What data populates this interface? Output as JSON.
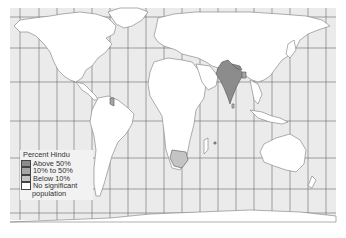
{
  "map": {
    "title": "Percent Hindu",
    "type": "world choropleth",
    "colors": {
      "ocean": "#ebebeb",
      "land": "#ffffff",
      "border": "#7a7a7a",
      "grid": "#6a6a6a",
      "above_50": "#8c8c8c",
      "10_to_50": "#a6a6a6",
      "below_10": "#c4c4c4",
      "none": "#ffffff"
    },
    "highlighted_regions": [
      {
        "region": "India",
        "category": "Above 50%"
      },
      {
        "region": "Nepal",
        "category": "Above 50%"
      },
      {
        "region": "Bangladesh",
        "category": "10% to 50%"
      },
      {
        "region": "Guyana / Suriname",
        "category": "10% to 50%"
      },
      {
        "region": "South Africa",
        "category": "Below 10%"
      }
    ]
  },
  "legend": {
    "title": "Percent Hindu",
    "items": [
      {
        "label": "Above 50%",
        "color": "#8c8c8c"
      },
      {
        "label": "10% to 50%",
        "color": "#a6a6a6"
      },
      {
        "label": "Below 10%",
        "color": "#c4c4c4"
      },
      {
        "label": "No significant",
        "color": "#ffffff"
      }
    ],
    "continuation": "population"
  }
}
